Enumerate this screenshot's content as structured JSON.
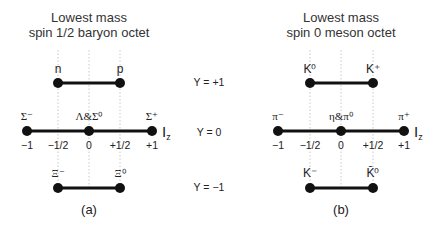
{
  "left": {
    "title_line1": "Lowest mass",
    "title_line2": "spin 1/2 baryon octet",
    "top": {
      "left": "n",
      "right": "p"
    },
    "mid": {
      "left": "Σ⁻",
      "center": "Λ&Σ⁰",
      "right": "Σ⁺"
    },
    "bottom": {
      "left": "Ξ⁻",
      "right": "Ξ⁰"
    },
    "ticks": [
      "−1",
      "−1/2",
      "0",
      "+1/2",
      "+1"
    ],
    "axis_label": "I",
    "axis_sub": "z",
    "caption": "(a)"
  },
  "right": {
    "title_line1": "Lowest mass",
    "title_line2": "spin 0 meson octet",
    "top": {
      "left": "K⁰",
      "right": "K⁺"
    },
    "mid": {
      "left": "π⁻",
      "center": "η&π⁰",
      "right": "π⁺"
    },
    "bottom": {
      "left": "K⁻",
      "right": "K̄⁰"
    },
    "ticks": [
      "−1",
      "−1/2",
      "0",
      "+1/2",
      "+1"
    ],
    "axis_label": "I",
    "axis_sub": "z",
    "caption": "(b)"
  },
  "hypercharge": {
    "top": "Y = +1",
    "mid": "Y = 0",
    "bottom": "Y = −1"
  }
}
